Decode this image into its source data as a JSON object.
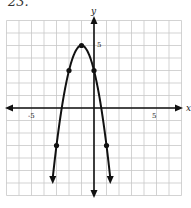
{
  "problem": {
    "label": "23."
  },
  "chart_data": {
    "type": "line",
    "title": "",
    "xlabel": "x",
    "ylabel": "y",
    "xlim": [
      -7,
      7
    ],
    "ylim": [
      -7,
      7
    ],
    "grid": true,
    "tick_labels": {
      "x": [
        "-5",
        "5"
      ],
      "y": [
        "5"
      ]
    },
    "equation": "y = -2(x+1)^2 + 5",
    "series": [
      {
        "name": "parabola",
        "points": [
          {
            "x": -3,
            "y": -3
          },
          {
            "x": -2,
            "y": 3
          },
          {
            "x": -1,
            "y": 5
          },
          {
            "x": 0,
            "y": 3
          },
          {
            "x": 1,
            "y": -3
          }
        ],
        "vertex": {
          "x": -1,
          "y": 5
        },
        "opens": "down",
        "arrows_at_ends": true
      }
    ]
  },
  "axes": {
    "x_label": "x",
    "y_label": "y",
    "x_tick_neg": "-5",
    "x_tick_pos": "5",
    "y_tick": "5"
  },
  "colors": {
    "grid": "#c8c8c8",
    "axis": "#111111",
    "curve": "#111111"
  }
}
